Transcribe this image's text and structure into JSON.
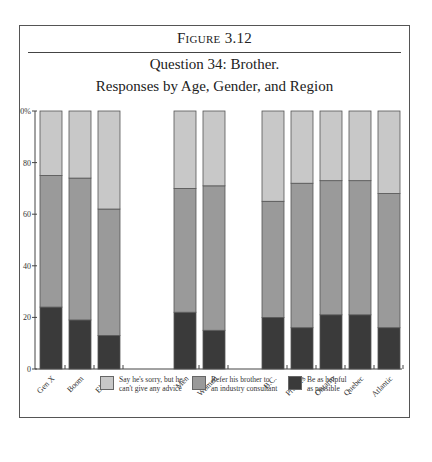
{
  "figure": {
    "label": "Figure 3.12",
    "title_line1": "Question 34: Brother.",
    "title_line2": "Responses by Age, Gender, and Region"
  },
  "colors": {
    "light": "#c8c8c8",
    "medium": "#9a9a9a",
    "dark": "#3a3a3a",
    "outline": "#555555",
    "axis": "#444444"
  },
  "chart_data": {
    "type": "bar",
    "stacked": true,
    "title": "Question 34: Brother. Responses by Age, Gender, and Region",
    "xlabel": "",
    "ylabel": "",
    "ylim": [
      0,
      100
    ],
    "yticks": [
      "0",
      "20",
      "40",
      "60",
      "80",
      "100%"
    ],
    "grid": false,
    "legend_position": "bottom",
    "groups": [
      {
        "name": "Age",
        "categories": [
          "Gen X",
          "Boom",
          "Elders"
        ]
      },
      {
        "name": "Gender",
        "categories": [
          "Men",
          "Women"
        ]
      },
      {
        "name": "Region",
        "categories": [
          "B.C.",
          "Prairies",
          "Ontario",
          "Quebec",
          "Atlantic"
        ]
      }
    ],
    "categories": [
      "Gen X",
      "Boom",
      "Elders",
      "Men",
      "Women",
      "B.C.",
      "Prairies",
      "Ontario",
      "Quebec",
      "Atlantic"
    ],
    "series": [
      {
        "name": "Be as helpful as possible",
        "color": "#3a3a3a",
        "values": [
          24,
          19,
          13,
          22,
          15,
          20,
          16,
          21,
          21,
          16
        ]
      },
      {
        "name": "Refer his brother to an industry consultant",
        "color": "#9a9a9a",
        "values": [
          51,
          55,
          49,
          48,
          56,
          45,
          56,
          52,
          52,
          52
        ]
      },
      {
        "name": "Say he's sorry, but he can't give any advice",
        "color": "#c8c8c8",
        "values": [
          25,
          26,
          38,
          30,
          29,
          35,
          28,
          27,
          27,
          32
        ]
      }
    ]
  },
  "legend": [
    {
      "label": "Say he's sorry, but he\ncan't give any advice",
      "color": "#c8c8c8"
    },
    {
      "label": "Refer his brother to\nan industry consultant",
      "color": "#9a9a9a"
    },
    {
      "label": "Be as helpful\nas possible",
      "color": "#3a3a3a"
    }
  ]
}
